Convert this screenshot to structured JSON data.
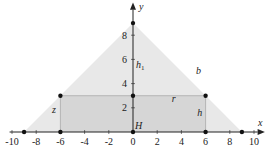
{
  "diagram": {
    "axes": {
      "x_label": "x",
      "y_label": "y",
      "x_range": [
        -10,
        10
      ],
      "y_range": [
        0,
        9.5
      ],
      "x_ticks": [
        -10,
        -8,
        -6,
        -4,
        -2,
        0,
        2,
        4,
        6,
        8,
        10
      ],
      "y_ticks": [
        2,
        4,
        6,
        8
      ]
    },
    "triangle": {
      "vertices": [
        [
          -9,
          0
        ],
        [
          9,
          0
        ],
        [
          0,
          9
        ]
      ],
      "fill": "#e8e8e8"
    },
    "rectangle": {
      "corners": [
        [
          -6,
          0
        ],
        [
          6,
          0
        ],
        [
          6,
          3
        ],
        [
          -6,
          3
        ]
      ],
      "fill": "#d6d6d6"
    },
    "points": [
      [
        -9,
        0
      ],
      [
        -6,
        0
      ],
      [
        0,
        0
      ],
      [
        6,
        0
      ],
      [
        9,
        0
      ],
      [
        -6,
        3
      ],
      [
        0,
        3
      ],
      [
        6,
        3
      ],
      [
        0,
        9
      ]
    ],
    "labels": {
      "b": "b",
      "r": "r",
      "h": "h",
      "z": "z",
      "h1": "h",
      "h1_sub": "1",
      "H": "H"
    }
  }
}
